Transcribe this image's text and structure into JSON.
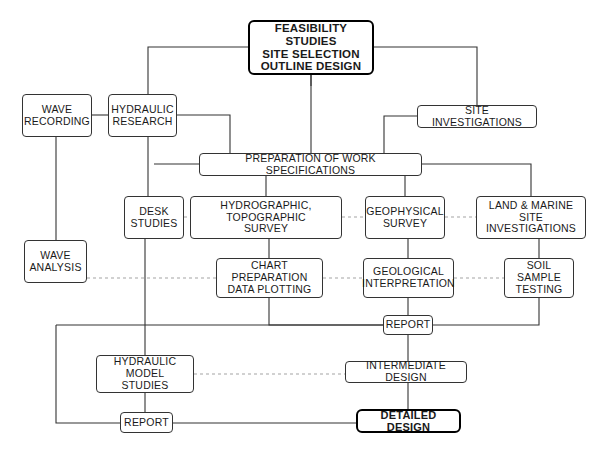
{
  "diagram": {
    "background_color": "#ffffff",
    "line_color": "#333333",
    "dashed_line_color": "#999999",
    "box_border_color": "#333333",
    "emphasis_border_color": "#000000",
    "nodes": [
      {
        "id": "feasibility",
        "label": "FEASIBILITY STUDIES\nSITE SELECTION\nOUTLINE DESIGN",
        "x": 248,
        "y": 20,
        "w": 126,
        "h": 55,
        "font_size": 11.5,
        "emphasis": true
      },
      {
        "id": "wave_recording",
        "label": "WAVE\nRECORDING",
        "x": 22,
        "y": 94,
        "w": 70,
        "h": 43,
        "font_size": 10.5,
        "emphasis": false
      },
      {
        "id": "hydraulic_research",
        "label": "HYDRAULIC\nRESEARCH",
        "x": 108,
        "y": 94,
        "w": 69,
        "h": 43,
        "font_size": 10.5,
        "emphasis": false
      },
      {
        "id": "site_investigations",
        "label": "SITE INVESTIGATIONS",
        "x": 417,
        "y": 105,
        "w": 120,
        "h": 23,
        "font_size": 10.5,
        "emphasis": false
      },
      {
        "id": "preparation",
        "label": "PREPARATION OF WORK SPECIFICATIONS",
        "x": 199,
        "y": 153,
        "w": 223,
        "h": 23,
        "font_size": 10.5,
        "emphasis": false
      },
      {
        "id": "desk_studies",
        "label": "DESK\nSTUDIES",
        "x": 124,
        "y": 196,
        "w": 60,
        "h": 43,
        "font_size": 10.5,
        "emphasis": false
      },
      {
        "id": "hydro_survey",
        "label": "HYDROGRAPHIC, TOPOGRAPHIC\nSURVEY",
        "x": 190,
        "y": 196,
        "w": 152,
        "h": 43,
        "font_size": 10.5,
        "emphasis": false
      },
      {
        "id": "geophysical_survey",
        "label": "GEOPHYSICAL\nSURVEY",
        "x": 365,
        "y": 196,
        "w": 80,
        "h": 43,
        "font_size": 10.5,
        "emphasis": false
      },
      {
        "id": "land_marine",
        "label": "LAND & MARINE SITE\nINVESTIGATIONS",
        "x": 476,
        "y": 196,
        "w": 110,
        "h": 43,
        "font_size": 10.5,
        "emphasis": false
      },
      {
        "id": "wave_analysis",
        "label": "WAVE\nANALYSIS",
        "x": 24,
        "y": 240,
        "w": 63,
        "h": 43,
        "font_size": 10.5,
        "emphasis": false
      },
      {
        "id": "chart_preparation",
        "label": "CHART PREPARATION\nDATA PLOTTING",
        "x": 216,
        "y": 258,
        "w": 107,
        "h": 40,
        "font_size": 10.5,
        "emphasis": false
      },
      {
        "id": "geological_interpretation",
        "label": "GEOLOGICAL\nINTERPRETATION",
        "x": 363,
        "y": 258,
        "w": 91,
        "h": 40,
        "font_size": 10.5,
        "emphasis": false
      },
      {
        "id": "soil_sample",
        "label": "SOIL SAMPLE\nTESTING",
        "x": 504,
        "y": 258,
        "w": 70,
        "h": 40,
        "font_size": 10.5,
        "emphasis": false
      },
      {
        "id": "report_mid",
        "label": "REPORT",
        "x": 383,
        "y": 315,
        "w": 50,
        "h": 20,
        "font_size": 10.5,
        "emphasis": false
      },
      {
        "id": "hydraulic_model",
        "label": "HYDRAULIC MODEL\nSTUDIES",
        "x": 96,
        "y": 355,
        "w": 98,
        "h": 38,
        "font_size": 10.5,
        "emphasis": false
      },
      {
        "id": "intermediate_design",
        "label": "INTERMEDIATE DESIGN",
        "x": 345,
        "y": 361,
        "w": 122,
        "h": 22,
        "font_size": 10.5,
        "emphasis": false
      },
      {
        "id": "report_bottom",
        "label": "REPORT",
        "x": 120,
        "y": 412,
        "w": 53,
        "h": 21,
        "font_size": 10.5,
        "emphasis": false
      },
      {
        "id": "detailed_design",
        "label": "DETAILED DESIGN",
        "x": 356,
        "y": 409,
        "w": 105,
        "h": 24,
        "font_size": 11,
        "emphasis": true
      }
    ],
    "connections": [
      {
        "name": "feasibility-to-left-spine",
        "style": "solid",
        "points": "311,75 311,86"
      },
      {
        "name": "feasibility-left-to-hydraulic-research",
        "style": "solid",
        "points": "248,47 148,47 148,94"
      },
      {
        "name": "feasibility-right-to-site-investigations",
        "style": "solid",
        "points": "374,47 477,47 477,105"
      },
      {
        "name": "feasibility-down-to-preparation",
        "style": "solid",
        "points": "311,75 311,153"
      },
      {
        "name": "hydraulic-research-to-wave-recording",
        "style": "solid",
        "points": "108,115 92,115"
      },
      {
        "name": "hydraulic-research-right-to-preparation",
        "style": "solid",
        "points": "177,115 230,115 230,153"
      },
      {
        "name": "hydraulic-research-down-to-desk-row",
        "style": "solid",
        "points": "148,137 148,196"
      },
      {
        "name": "site-investigations-left-to-preparation",
        "style": "solid",
        "points": "417,116 384,116 384,153"
      },
      {
        "name": "preparation-left-to-desk-studies",
        "style": "solid",
        "points": "199,164 154,164"
      },
      {
        "name": "preparation-down-to-hydro-survey",
        "style": "solid",
        "points": "266,176 266,196"
      },
      {
        "name": "preparation-down-to-geophysical",
        "style": "solid",
        "points": "405,176 405,196"
      },
      {
        "name": "preparation-right-to-land-marine",
        "style": "solid",
        "points": "422,164 531,164 531,196"
      },
      {
        "name": "wave-recording-down-to-wave-analysis",
        "style": "solid",
        "points": "56,137 56,240"
      },
      {
        "name": "desk-studies-row-dashed-to-hydro-survey",
        "style": "dashed",
        "points": "184,217 190,217"
      },
      {
        "name": "hydro-survey-dashed-to-geophysical",
        "style": "dashed",
        "points": "342,217 365,217"
      },
      {
        "name": "geophysical-dashed-to-land-marine",
        "style": "dashed",
        "points": "445,217 476,217"
      },
      {
        "name": "desk-studies-down-to-hydraulic-model",
        "style": "solid",
        "points": "145,239 145,355"
      },
      {
        "name": "hydro-survey-down-to-chart-preparation",
        "style": "solid",
        "points": "269,239 269,258"
      },
      {
        "name": "geophysical-down-to-geological",
        "style": "solid",
        "points": "408,239 408,258"
      },
      {
        "name": "land-marine-down-to-soil-sample",
        "style": "solid",
        "points": "539,239 539,258"
      },
      {
        "name": "wave-analysis-dashed-to-chart-preparation",
        "style": "dashed",
        "points": "87,278 216,278"
      },
      {
        "name": "chart-prep-dashed-to-geological",
        "style": "dashed",
        "points": "323,278 363,278"
      },
      {
        "name": "geological-dashed-to-soil-sample",
        "style": "dashed",
        "points": "454,278 504,278"
      },
      {
        "name": "chart-preparation-down-to-report-mid",
        "style": "solid",
        "points": "269,298 269,325 383,325"
      },
      {
        "name": "geological-down-to-report-mid",
        "style": "solid",
        "points": "408,298 408,315"
      },
      {
        "name": "soil-sample-down-to-report-mid",
        "style": "solid",
        "points": "539,298 539,325 433,325"
      },
      {
        "name": "report-mid-left-to-wave-analysis-spine",
        "style": "solid",
        "points": "383,325 56,325"
      },
      {
        "name": "report-mid-down-to-intermediate-design",
        "style": "solid",
        "points": "408,335 408,361"
      },
      {
        "name": "hydraulic-model-dashed-to-intermediate-design",
        "style": "dashed",
        "points": "194,374 345,374"
      },
      {
        "name": "hydraulic-model-down-to-report-bottom",
        "style": "solid",
        "points": "145,393 145,412"
      },
      {
        "name": "wave-analysis-spine-to-report-bottom",
        "style": "solid",
        "points": "56,325 56,423 120,423"
      },
      {
        "name": "report-bottom-to-detailed-design",
        "style": "solid",
        "points": "173,423 356,423"
      },
      {
        "name": "intermediate-design-down-to-detailed-design",
        "style": "solid",
        "points": "408,383 408,409"
      }
    ]
  }
}
